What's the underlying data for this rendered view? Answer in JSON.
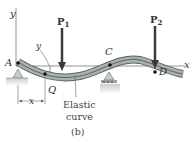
{
  "figure": {
    "caption": "(b)",
    "axes": {
      "x_label": "x",
      "y_label": "y"
    },
    "points": {
      "A": "A",
      "Q": "Q",
      "C": "C",
      "D": "D"
    },
    "loads": [
      {
        "label": "P",
        "subscript": "1"
      },
      {
        "label": "P",
        "subscript": "2"
      }
    ],
    "dimension": {
      "x_label": "x",
      "y_label": "y"
    },
    "annotation": {
      "line1": "Elastic",
      "line2": "curve"
    },
    "colors": {
      "beam_fill": "#a9b0b2",
      "beam_edge": "#5a6163",
      "support_fill": "#c8ccce",
      "ground_fill": "#d4d7d8",
      "arrow": "#3a3a3a"
    }
  }
}
